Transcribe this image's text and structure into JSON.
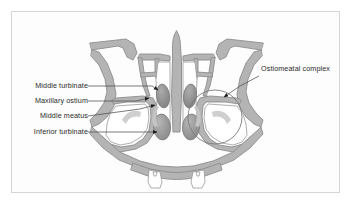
{
  "figure": {
    "kind": "anatomical-illustration",
    "frame": {
      "border_color": "#d6d6d6",
      "background": "#fdfdfd"
    },
    "palette": {
      "background": "#ffffff",
      "tissue_fill": "#b4b4b4",
      "tissue_outline": "#8d8d8d",
      "airspace_fill": "#ffffff",
      "turbinate_fill": "#9a9a9a",
      "turbinate_shadow": "#8a8a8a",
      "mucosa_light": "#c9c9c9",
      "leader_line": "#5a5a5a",
      "label_text": "#2a2a2a",
      "highlight_circle": "#7a7a7a"
    }
  },
  "labels": {
    "left": [
      {
        "id": "middle-turbinate",
        "text": "Middle turbinate",
        "x": 19,
        "y": 85,
        "anchor_x": 100,
        "anchor_y": 88,
        "tip_x": 160,
        "tip_y": 90
      },
      {
        "id": "maxillary-ostium",
        "text": "Maxillary ostium",
        "x": 19,
        "y": 100,
        "anchor_x": 100,
        "anchor_y": 103,
        "tip_x": 152,
        "tip_y": 99
      },
      {
        "id": "middle-meatus",
        "text": "Middle meatus",
        "x": 31,
        "y": 115,
        "anchor_x": 100,
        "anchor_y": 118,
        "tip_x": 161,
        "tip_y": 106
      },
      {
        "id": "inferior-turbinate",
        "text": "Inferior turbinate",
        "x": 19,
        "y": 131,
        "anchor_x": 100,
        "anchor_y": 134,
        "tip_x": 163,
        "tip_y": 134
      }
    ],
    "right": [
      {
        "id": "ostiomeatal-complex",
        "text": "Ostiomeatal complex",
        "x": 262,
        "y": 69,
        "anchor_x": 258,
        "anchor_y": 76,
        "tip_x": 221,
        "tip_y": 98
      }
    ]
  },
  "annotations": {
    "highlight_circle": {
      "cx": 215,
      "cy": 117,
      "r": 27
    }
  }
}
